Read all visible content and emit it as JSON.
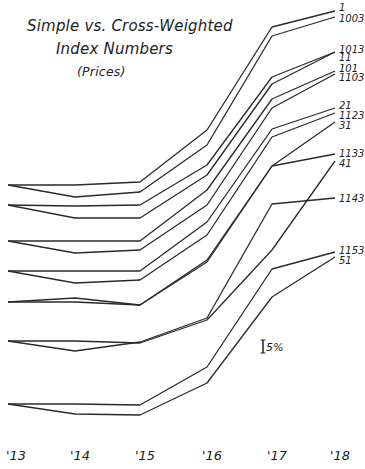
{
  "chart_data": {
    "type": "line",
    "title": "Simple vs. Cross-Weighted",
    "title_line2": "Index Numbers",
    "subtitle": "(Prices)",
    "xlabel": "",
    "ylabel": "",
    "categories": [
      "'13",
      "'14",
      "'15",
      "'16",
      "'17",
      "'18"
    ],
    "scale_note": "5%",
    "grid": false,
    "legend": "labels at right end of each line",
    "note": "Y values are pixel positions (smaller = higher); lines are offset pairs, not a shared numeric axis.",
    "series": [
      {
        "name": "1",
        "values": [
          185,
          185,
          182,
          130,
          27,
          11
        ]
      },
      {
        "name": "1003",
        "values": [
          185,
          197,
          192,
          145,
          36,
          17
        ]
      },
      {
        "name": "1013",
        "values": [
          205,
          206,
          205,
          165,
          77,
          52
        ]
      },
      {
        "name": "11",
        "values": [
          205,
          218,
          218,
          175,
          84,
          52
        ]
      },
      {
        "name": "101",
        "values": [
          241,
          241,
          241,
          190,
          99,
          71
        ]
      },
      {
        "name": "1103",
        "values": [
          241,
          253,
          250,
          205,
          108,
          74
        ]
      },
      {
        "name": "21",
        "values": [
          271,
          271,
          271,
          222,
          129,
          108
        ]
      },
      {
        "name": "1123",
        "values": [
          271,
          283,
          280,
          235,
          137,
          113
        ]
      },
      {
        "name": "31",
        "values": [
          302,
          302,
          305,
          262,
          166,
          122
        ]
      },
      {
        "name": "1133",
        "values": [
          302,
          298,
          305,
          260,
          166,
          154
        ]
      },
      {
        "name": "41",
        "values": [
          341,
          341,
          343,
          320,
          250,
          161
        ]
      },
      {
        "name": "1143",
        "values": [
          341,
          351,
          342,
          318,
          204,
          198
        ]
      },
      {
        "name": "1153",
        "values": [
          404,
          404,
          405,
          367,
          269,
          252
        ]
      },
      {
        "name": "51",
        "values": [
          404,
          414,
          415,
          383,
          297,
          257
        ]
      }
    ]
  },
  "x_positions": [
    8,
    75,
    140,
    207,
    272,
    335
  ]
}
